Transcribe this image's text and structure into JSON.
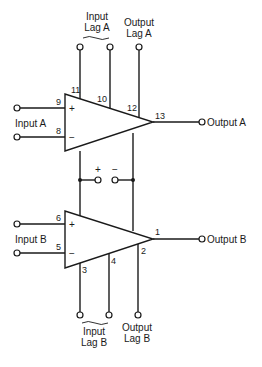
{
  "diagram": {
    "type": "dual-opamp-pinout",
    "amplifier_a": {
      "inputs_label": "Input A",
      "output_label": "Output A",
      "input_lag_label_line1": "Input",
      "input_lag_label_line2": "Lag A",
      "output_lag_label_line1": "Output",
      "output_lag_label_line2": "Lag A",
      "pins": {
        "non_inverting": "9",
        "inverting": "8",
        "input_lag_1": "11",
        "input_lag_2": "10",
        "output_lag": "12",
        "output": "13"
      },
      "plus_sign": "+",
      "minus_sign": "−"
    },
    "amplifier_b": {
      "inputs_label": "Input B",
      "output_label": "Output B",
      "input_lag_label_line1": "Input",
      "input_lag_label_line2": "Lag B",
      "output_lag_label_line1": "Output",
      "output_lag_label_line2": "Lag B",
      "pins": {
        "non_inverting": "6",
        "inverting": "5",
        "input_lag_1": "3",
        "input_lag_2": "4",
        "output_lag": "2",
        "output": "1"
      },
      "plus_sign": "+",
      "minus_sign": "−"
    },
    "power": {
      "positive_label": "+",
      "negative_label": "−"
    }
  }
}
